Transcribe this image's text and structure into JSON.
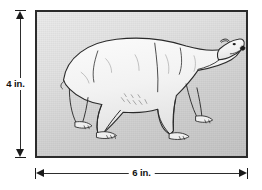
{
  "diagram": {
    "picture": {
      "subject": "polar-bear",
      "subject_description": "Line drawing of a polar bear standing in profile facing right",
      "frame_color": "#2b2b2b",
      "background_color": "#d9d9d9"
    },
    "dimensions": {
      "height": {
        "label": "4 in.",
        "value": 4,
        "unit": "in.",
        "orientation": "vertical",
        "arrow_style": "double-headed-with-ticks"
      },
      "width": {
        "label": "6 in.",
        "value": 6,
        "unit": "in.",
        "orientation": "horizontal",
        "arrow_style": "double-headed-with-ticks"
      }
    },
    "colors": {
      "line": "#1b1b1b",
      "text": "#111111",
      "page_background": "#ffffff"
    }
  }
}
